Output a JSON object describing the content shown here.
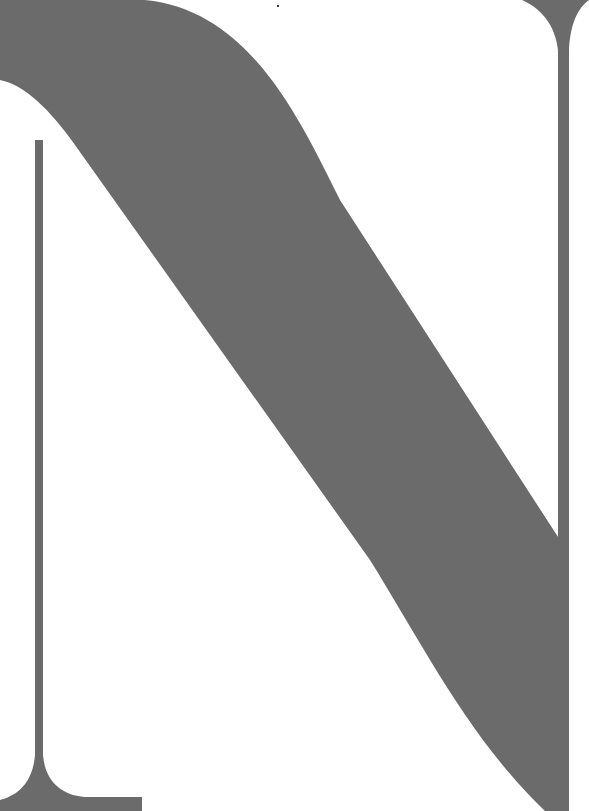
{
  "artwork": {
    "subject": "letter-N",
    "glyph": "N",
    "colors": {
      "background": "#ffffff",
      "glyph": "#6b6b6b"
    }
  }
}
